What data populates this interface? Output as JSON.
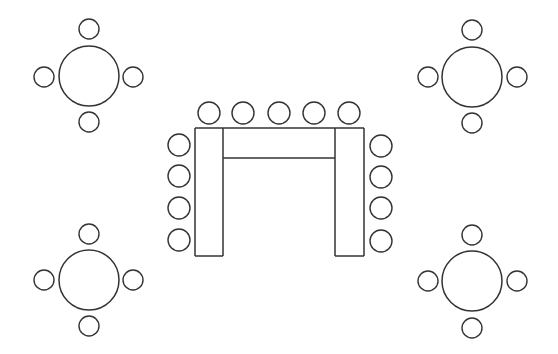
{
  "diagram": {
    "title": "Seating layout: U-shape conference table with four round tables",
    "canvas": {
      "width": 558,
      "height": 354,
      "background": "#ffffff"
    },
    "stroke_color": "#333333",
    "round_tables": [
      {
        "name": "round-table-top-left",
        "center": [
          89,
          76
        ],
        "radius": 30,
        "chair_radius": 10,
        "chairs": [
          [
            89,
            29
          ],
          [
            44,
            77
          ],
          [
            133,
            77
          ],
          [
            89,
            122
          ]
        ]
      },
      {
        "name": "round-table-top-right",
        "center": [
          472,
          77
        ],
        "radius": 30,
        "chair_radius": 10,
        "chairs": [
          [
            472,
            30
          ],
          [
            428,
            77
          ],
          [
            517,
            77
          ],
          [
            472,
            123
          ]
        ]
      },
      {
        "name": "round-table-bottom-left",
        "center": [
          89,
          280
        ],
        "radius": 30,
        "chair_radius": 10,
        "chairs": [
          [
            89,
            234
          ],
          [
            44,
            280
          ],
          [
            133,
            280
          ],
          [
            89,
            326
          ]
        ]
      },
      {
        "name": "round-table-bottom-right",
        "center": [
          472,
          281
        ],
        "radius": 30,
        "chair_radius": 10,
        "chairs": [
          [
            472,
            235
          ],
          [
            428,
            281
          ],
          [
            517,
            281
          ],
          [
            472,
            328
          ]
        ]
      }
    ],
    "u_table": {
      "name": "u-shape-table",
      "outer": {
        "x": 195,
        "y": 128,
        "width": 169,
        "height": 128
      },
      "left_leg_inner_x": 223,
      "right_leg_inner_x": 335,
      "crossbar_bottom_y": 158,
      "chair_radius": 11,
      "chairs_top": [
        [
          209,
          113
        ],
        [
          243,
          113
        ],
        [
          279,
          113
        ],
        [
          314,
          113
        ],
        [
          349,
          113
        ]
      ],
      "chairs_left": [
        [
          179,
          145
        ],
        [
          179,
          176
        ],
        [
          179,
          208
        ],
        [
          179,
          240
        ]
      ],
      "chairs_right": [
        [
          381,
          146
        ],
        [
          381,
          177
        ],
        [
          381,
          208
        ],
        [
          381,
          241
        ]
      ]
    }
  }
}
